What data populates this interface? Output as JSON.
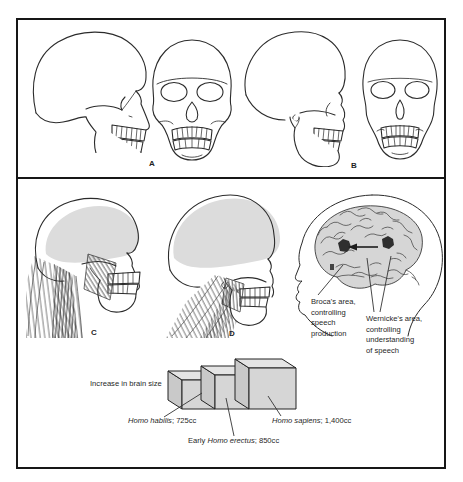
{
  "figure": {
    "top_labels": {
      "a": "A",
      "b": "B"
    },
    "bottom_labels": {
      "c": "C",
      "d": "D"
    },
    "broca_lines": [
      "Broca's area,",
      "controlling",
      "speech",
      "production"
    ],
    "wernicke_lines": [
      "Wernicke's area,",
      "controlling",
      "understanding",
      "of speech"
    ],
    "brain_size": {
      "caption": "Increase in brain size",
      "blocks": [
        {
          "prefix": "",
          "species": "Homo habilis",
          "suffix": "; 725cc",
          "volume_cc": 725
        },
        {
          "prefix": "Early ",
          "species": "Homo erectus",
          "suffix": "; 850cc",
          "volume_cc": 850
        },
        {
          "prefix": "",
          "species": "Homo sapiens",
          "suffix": "; 1,400cc",
          "volume_cc": 1400
        }
      ]
    }
  }
}
